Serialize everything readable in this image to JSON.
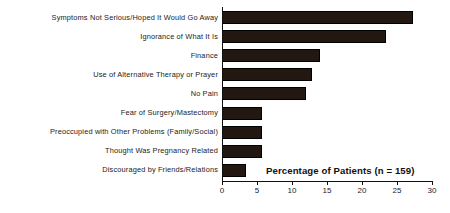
{
  "chart_data": {
    "type": "bar",
    "orientation": "horizontal",
    "title": "Percentage of Patients (n = 159)",
    "xlabel": "",
    "ylabel": "",
    "xlim": [
      0,
      30
    ],
    "grid": false,
    "legend": null,
    "bar_color": "#231712",
    "axis_color": "#111111",
    "categories": [
      "Symptoms Not Serious/Hoped It Would Go Away",
      "Ignorance of What It Is",
      "Finance",
      "Use of Alternative Therapy or Prayer",
      "No Pain",
      "Fear of Surgery/Mastectomy",
      "Preoccupied with Other Problems (Family/Social)",
      "Thought Was Pregnancy Related",
      "Discouraged by Friends/Relations"
    ],
    "values": [
      27.3,
      23.4,
      14.0,
      12.9,
      12.0,
      5.7,
      5.7,
      5.7,
      3.4
    ],
    "ticks": [
      0,
      5,
      10,
      15,
      20,
      25,
      30
    ],
    "tick_labels": [
      "0",
      "5",
      "10",
      "15",
      "20",
      "25",
      "30"
    ]
  }
}
